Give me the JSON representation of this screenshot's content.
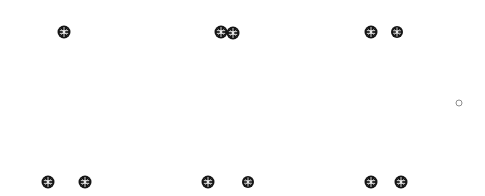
{
  "canvas": {
    "width": 485,
    "height": 196,
    "background_color": "#ffffff",
    "node_color": "#151515",
    "node_glyph_color": "#e8e8e8",
    "ring_color": "#8d8d8d"
  },
  "markers": [
    {
      "name": "node-top-left-1",
      "type": "filled-node",
      "x": 64,
      "y": 32,
      "size": 13
    },
    {
      "name": "node-top-center-1",
      "type": "filled-node",
      "x": 221,
      "y": 32,
      "size": 13
    },
    {
      "name": "node-top-center-2",
      "type": "filled-node",
      "x": 233,
      "y": 33,
      "size": 13
    },
    {
      "name": "node-top-right-1",
      "type": "filled-node",
      "x": 371,
      "y": 32,
      "size": 13
    },
    {
      "name": "node-top-right-2",
      "type": "filled-node",
      "x": 397,
      "y": 32,
      "size": 12
    },
    {
      "name": "ring-middle-right",
      "type": "outline-ring",
      "x": 459,
      "y": 103,
      "size": 7
    },
    {
      "name": "node-bottom-left-1",
      "type": "filled-node",
      "x": 48,
      "y": 182,
      "size": 13
    },
    {
      "name": "node-bottom-left-2",
      "type": "filled-node",
      "x": 85,
      "y": 182,
      "size": 13
    },
    {
      "name": "node-bottom-center-1",
      "type": "filled-node",
      "x": 208,
      "y": 182,
      "size": 13
    },
    {
      "name": "node-bottom-center-2",
      "type": "filled-node",
      "x": 248,
      "y": 182,
      "size": 12
    },
    {
      "name": "node-bottom-right-1",
      "type": "filled-node",
      "x": 371,
      "y": 182,
      "size": 13
    },
    {
      "name": "node-bottom-right-2",
      "type": "filled-node",
      "x": 401,
      "y": 182,
      "size": 13
    }
  ]
}
